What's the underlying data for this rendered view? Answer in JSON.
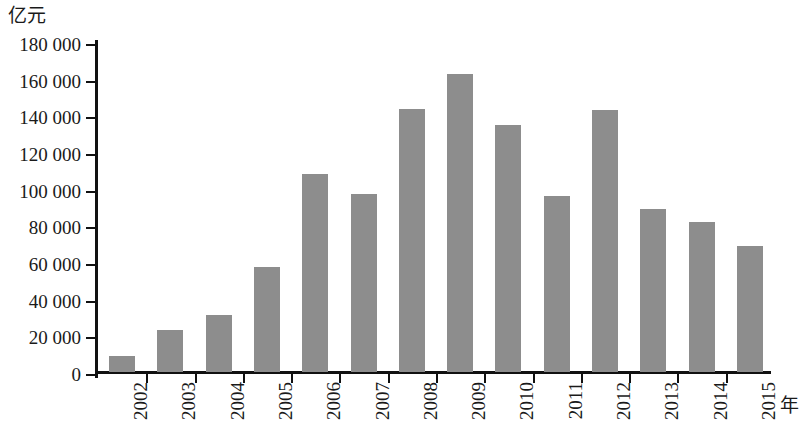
{
  "chart_data": {
    "type": "bar",
    "title": "",
    "subtitle": "",
    "xlabel": "年",
    "ylabel": "亿元",
    "categories": [
      "2002",
      "2003",
      "2004",
      "2005",
      "2006",
      "2007",
      "2008",
      "2009",
      "2010",
      "2011",
      "2012",
      "2013",
      "2014",
      "2015"
    ],
    "values": [
      9000,
      23000,
      31000,
      57500,
      108000,
      97000,
      143500,
      162500,
      134500,
      96000,
      143000,
      89000,
      82000,
      69000
    ],
    "ylim": [
      0,
      180000
    ],
    "ytick_step": 20000,
    "ytick_labels": [
      "0",
      "20 000",
      "40 000",
      "60 000",
      "80 000",
      "100 000",
      "120 000",
      "140 000",
      "160 000",
      "180 000"
    ],
    "ytick_values": [
      0,
      20000,
      40000,
      60000,
      80000,
      100000,
      120000,
      140000,
      160000,
      180000
    ],
    "grid": false,
    "legend": null,
    "bar_color": "#8d8d8d",
    "axis_color": "#111111"
  }
}
